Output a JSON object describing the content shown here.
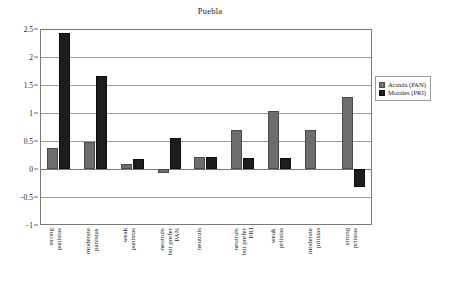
{
  "chart_data": {
    "type": "bar",
    "title": "Puebla",
    "xlabel": "",
    "ylabel": "",
    "ylim": [
      -1,
      2.5
    ],
    "yticks": [
      2.5,
      2,
      1.5,
      1,
      0.5,
      0,
      -0.5,
      -1
    ],
    "ytick_labels": [
      "2.5",
      "2",
      "1.5",
      "1",
      "0.5",
      "0",
      "−0.5",
      "−1"
    ],
    "grid": true,
    "legend_position": "right",
    "categories": [
      "strong\npanistas",
      "moderate\npanistas",
      "weak\npanistas",
      "neutrals\nbut prefer\nPAN",
      "neutrals",
      "neutrals\nbut prefer\nPRI",
      "weak\npriístas",
      "moderate\npriístas",
      "strong\npriístas"
    ],
    "series": [
      {
        "name": "Aranda (PAN)",
        "color": "#6e6e6e",
        "values": [
          0.38,
          0.49,
          0.09,
          -0.07,
          0.21,
          0.7,
          1.04,
          0.7,
          1.29
        ]
      },
      {
        "name": "Morales (PRI)",
        "color": "#1c1c1c",
        "values": [
          2.43,
          1.66,
          0.17,
          0.56,
          0.21,
          0.2,
          0.2,
          0.0,
          -0.33
        ]
      }
    ]
  },
  "legend": {
    "items": [
      {
        "label": "Aranda (PAN)"
      },
      {
        "label": "Morales (PRI)"
      }
    ]
  }
}
